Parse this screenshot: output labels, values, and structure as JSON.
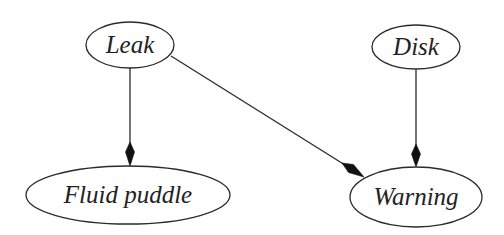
{
  "diagram": {
    "type": "bayesian-network",
    "background": "#ffffff",
    "stroke_color": "#2a2a2a",
    "arrow_color": "#111111",
    "nodes": [
      {
        "id": "leak",
        "label": "Leak",
        "cx": 130,
        "cy": 45,
        "rx": 44,
        "ry": 23,
        "font_size": 25
      },
      {
        "id": "disk",
        "label": "Disk",
        "cx": 416,
        "cy": 47,
        "rx": 44,
        "ry": 22,
        "font_size": 25
      },
      {
        "id": "fluid_puddle",
        "label": "Fluid puddle",
        "cx": 128,
        "cy": 195,
        "rx": 102,
        "ry": 29,
        "font_size": 25
      },
      {
        "id": "warning",
        "label": "Warning",
        "cx": 416,
        "cy": 197,
        "rx": 66,
        "ry": 30,
        "font_size": 25
      }
    ],
    "edges": [
      {
        "from": "leak",
        "to": "fluid_puddle"
      },
      {
        "from": "leak",
        "to": "warning"
      },
      {
        "from": "disk",
        "to": "warning"
      }
    ]
  }
}
